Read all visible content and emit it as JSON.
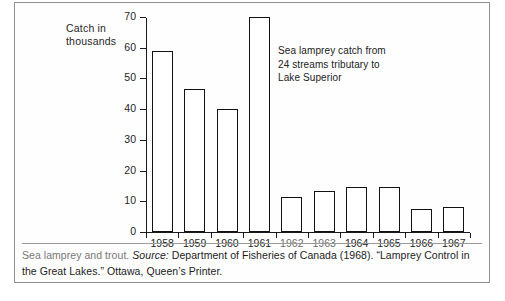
{
  "chart_data": {
    "type": "bar",
    "title": "",
    "xlabel": "",
    "ylabel": "Catch in thousands",
    "ylim": [
      0,
      70
    ],
    "yticks": [
      0,
      10,
      20,
      30,
      40,
      50,
      60,
      70
    ],
    "grid": false,
    "legend": "none",
    "annotation": "Sea lamprey catch from 24 streams tributary to Lake Superior",
    "categories": [
      "1958",
      "1959",
      "1960",
      "1961",
      "1962",
      "1963",
      "1964",
      "1965",
      "1966",
      "1967"
    ],
    "values": [
      59,
      46.5,
      40,
      70,
      11.5,
      13.5,
      14.5,
      14.5,
      7.5,
      8
    ]
  },
  "axis": {
    "y_label_line1": "Catch in",
    "y_label_line2": "thousands",
    "y_tick_labels": [
      "0",
      "10",
      "20",
      "30",
      "40",
      "50",
      "60",
      "70"
    ],
    "x_tick_labels": [
      "1958",
      "1959",
      "1960",
      "1961",
      "1962",
      "1963",
      "1964",
      "1965",
      "1966",
      "1967"
    ]
  },
  "annotation": {
    "line1": "Sea lamprey catch from",
    "line2": "24 streams tributary to",
    "line3": "Lake Superior"
  },
  "caption": {
    "lead": "Sea lamprey and trout.",
    "source_label": "Source:",
    "source_text": "Department of Fisheries of Canada (1968). “Lamprey",
    "line2": "Control in the Great Lakes.” Ottawa, Queen’s Printer."
  }
}
